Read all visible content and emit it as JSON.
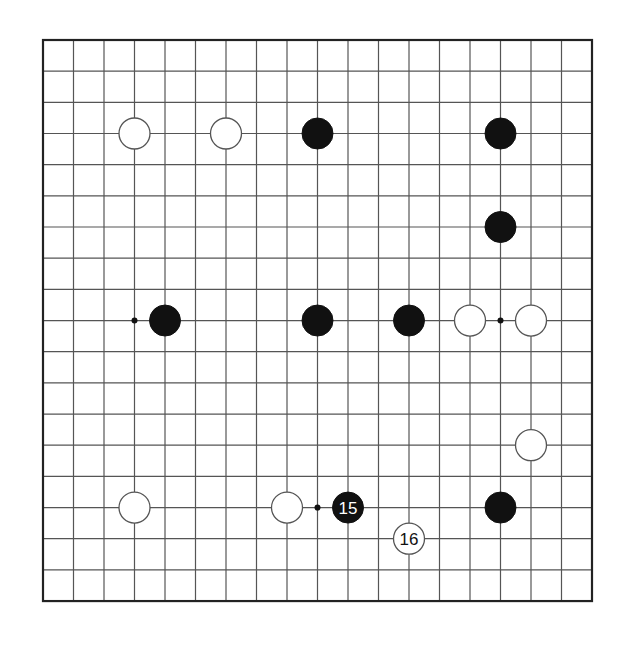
{
  "board": {
    "size": 19,
    "origin_x": 43,
    "origin_y": 40,
    "spacing_x": 30.5,
    "spacing_y": 31.17,
    "line_color": "#555555",
    "border_color": "#222222",
    "stone_radius": 15.5,
    "black_color": "#111111",
    "white_fill": "#ffffff",
    "white_stroke": "#555555",
    "hoshi": [
      [
        3,
        3
      ],
      [
        9,
        3
      ],
      [
        15,
        3
      ],
      [
        3,
        9
      ],
      [
        9,
        9
      ],
      [
        15,
        9
      ],
      [
        3,
        15
      ],
      [
        9,
        15
      ],
      [
        15,
        15
      ]
    ]
  },
  "stones": [
    {
      "color": "white",
      "col": 3,
      "row": 3,
      "label": ""
    },
    {
      "color": "white",
      "col": 6,
      "row": 3,
      "label": ""
    },
    {
      "color": "black",
      "col": 9,
      "row": 3,
      "label": ""
    },
    {
      "color": "black",
      "col": 15,
      "row": 3,
      "label": ""
    },
    {
      "color": "black",
      "col": 15,
      "row": 6,
      "label": ""
    },
    {
      "color": "black",
      "col": 4,
      "row": 9,
      "label": ""
    },
    {
      "color": "black",
      "col": 9,
      "row": 9,
      "label": ""
    },
    {
      "color": "black",
      "col": 12,
      "row": 9,
      "label": ""
    },
    {
      "color": "white",
      "col": 14,
      "row": 9,
      "label": ""
    },
    {
      "color": "white",
      "col": 16,
      "row": 9,
      "label": ""
    },
    {
      "color": "white",
      "col": 16,
      "row": 13,
      "label": ""
    },
    {
      "color": "white",
      "col": 3,
      "row": 15,
      "label": ""
    },
    {
      "color": "white",
      "col": 8,
      "row": 15,
      "label": ""
    },
    {
      "color": "black",
      "col": 10,
      "row": 15,
      "label": "15"
    },
    {
      "color": "black",
      "col": 15,
      "row": 15,
      "label": ""
    },
    {
      "color": "white",
      "col": 12,
      "row": 16,
      "label": "16"
    }
  ]
}
